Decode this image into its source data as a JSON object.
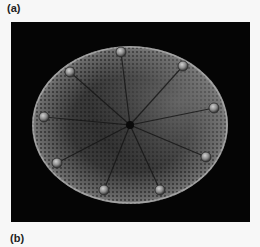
{
  "figure": {
    "panels": [
      {
        "label": "(a)",
        "image": {
          "subject": "scanning electron micrograph of a centric diatom valve",
          "background_color": "#050505",
          "features": {
            "shape": "elliptical disc",
            "radial_ribs": 9,
            "marginal_processes": 9,
            "central_pore": true,
            "texture": "honeycomb areolae"
          }
        }
      },
      {
        "label": "(b)"
      }
    ]
  }
}
